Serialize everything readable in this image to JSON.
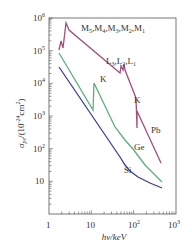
{
  "chart_data": {
    "type": "line",
    "title": "",
    "xlabel": "hν/keV",
    "ylabel": "σ_pe/(10^-24 cm^2)",
    "xscale": "log",
    "yscale": "log",
    "xlim": [
      1,
      1000
    ],
    "ylim": [
      1,
      1000000
    ],
    "x_ticks": [
      "1",
      "10",
      "10^2",
      "10^3"
    ],
    "y_ticks": [
      "10",
      "10^2",
      "10^3",
      "10^4",
      "10^5",
      "10^6"
    ],
    "grid": false,
    "legend": "inline labels",
    "series": [
      {
        "name": "Pb",
        "color": "#a0507a",
        "points": [
          [
            1.8,
            200000
          ],
          [
            2.5,
            500000
          ],
          [
            3.0,
            300000
          ],
          [
            3.3,
            900000
          ],
          [
            15,
            20000
          ],
          [
            15.5,
            50000
          ],
          [
            16,
            35000
          ],
          [
            16.5,
            60000
          ],
          [
            88,
            2000
          ],
          [
            88,
            7000
          ],
          [
            400,
            300
          ]
        ],
        "edges": [
          "M5,M4,M3,M2,M1",
          "L3,L2,L1",
          "K"
        ]
      },
      {
        "name": "Ge",
        "color": "#5fae7a",
        "points": [
          [
            1.8,
            150000
          ],
          [
            11,
            3000
          ],
          [
            11.1,
            20000
          ],
          [
            40,
            1000
          ],
          [
            100,
            180
          ],
          [
            400,
            20
          ]
        ],
        "edges": [
          "K"
        ]
      },
      {
        "name": "Si",
        "color": "#3a3f9a",
        "points": [
          [
            1.8,
            45000
          ],
          [
            10,
            1500
          ],
          [
            50,
            60
          ],
          [
            100,
            15
          ],
          [
            400,
            5
          ]
        ],
        "edges": []
      }
    ],
    "annotations": [
      "M5,M4,M3,M2,M1",
      "L3,L2,L1",
      "K",
      "K",
      "Pb",
      "Ge",
      "Si"
    ]
  },
  "labels": {
    "x_axis_title": "hν/keV",
    "y_axis_title_main": "σ",
    "y_axis_title_sub": "pe",
    "y_axis_title_rest": "/(10",
    "y_axis_title_exp": "-24",
    "y_axis_title_unit": "cm",
    "y_axis_title_unit_exp": "2",
    "y_axis_title_close": ")",
    "x_tick_1": "1",
    "x_tick_10": "10",
    "x_tick_100_base": "10",
    "x_tick_100_exp": "2",
    "x_tick_1000_base": "10",
    "x_tick_1000_exp": "3",
    "y_tick_10": "10",
    "y_tick_100_base": "10",
    "y_tick_100_exp": "2",
    "y_tick_1000_base": "10",
    "y_tick_1000_exp": "3",
    "y_tick_1e4_base": "10",
    "y_tick_1e4_exp": "4",
    "y_tick_1e5_base": "10",
    "y_tick_1e5_exp": "5",
    "y_tick_1e6_base": "10",
    "y_tick_1e6_exp": "6",
    "edge_M": "M5,M4,M3,M2,M1",
    "edge_M_parts": [
      "M",
      "5",
      ",M",
      "4",
      ",M",
      "3",
      ",M",
      "2",
      ",M",
      "1"
    ],
    "edge_L_parts": [
      "L",
      "3",
      ",L",
      "2",
      ",L",
      "1"
    ],
    "edge_K_ge": "K",
    "edge_K_pb": "K",
    "series_pb": "Pb",
    "series_ge": "Ge",
    "series_si": "Si"
  },
  "colors": {
    "pb": "#a0507a",
    "ge": "#5fae7a",
    "si": "#3a3f9a",
    "axis": "#555555"
  }
}
